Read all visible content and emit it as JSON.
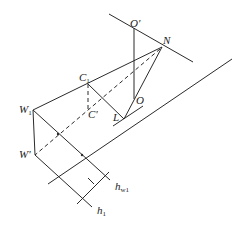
{
  "diagram": {
    "title": "",
    "stroke_color": "#2a2a2a",
    "background": "#ffffff",
    "labels": {
      "O_prime": {
        "main": "O",
        "mark": "'"
      },
      "N": {
        "main": "N"
      },
      "C1": {
        "main": "C",
        "sub": "1"
      },
      "C_prime": {
        "main": "C",
        "mark": "'"
      },
      "W1": {
        "main": "W",
        "sub": "1"
      },
      "W_prime": {
        "main": "W",
        "mark": "'"
      },
      "L": {
        "main": "L"
      },
      "O": {
        "main": "O"
      },
      "h_w1": {
        "main": "h",
        "sub": "w1"
      },
      "h_1": {
        "main": "h",
        "sub": "1"
      }
    },
    "points": {
      "O_prime": [
        134,
        28
      ],
      "N": [
        162,
        47
      ],
      "C1": [
        88,
        84
      ],
      "C_prime": [
        88,
        109
      ],
      "W1": [
        33,
        110
      ],
      "W_prime": [
        35,
        155
      ],
      "L": [
        124,
        119
      ],
      "O": [
        134,
        99
      ]
    },
    "dimension_marks": [
      "h_w1",
      "h_1"
    ]
  }
}
